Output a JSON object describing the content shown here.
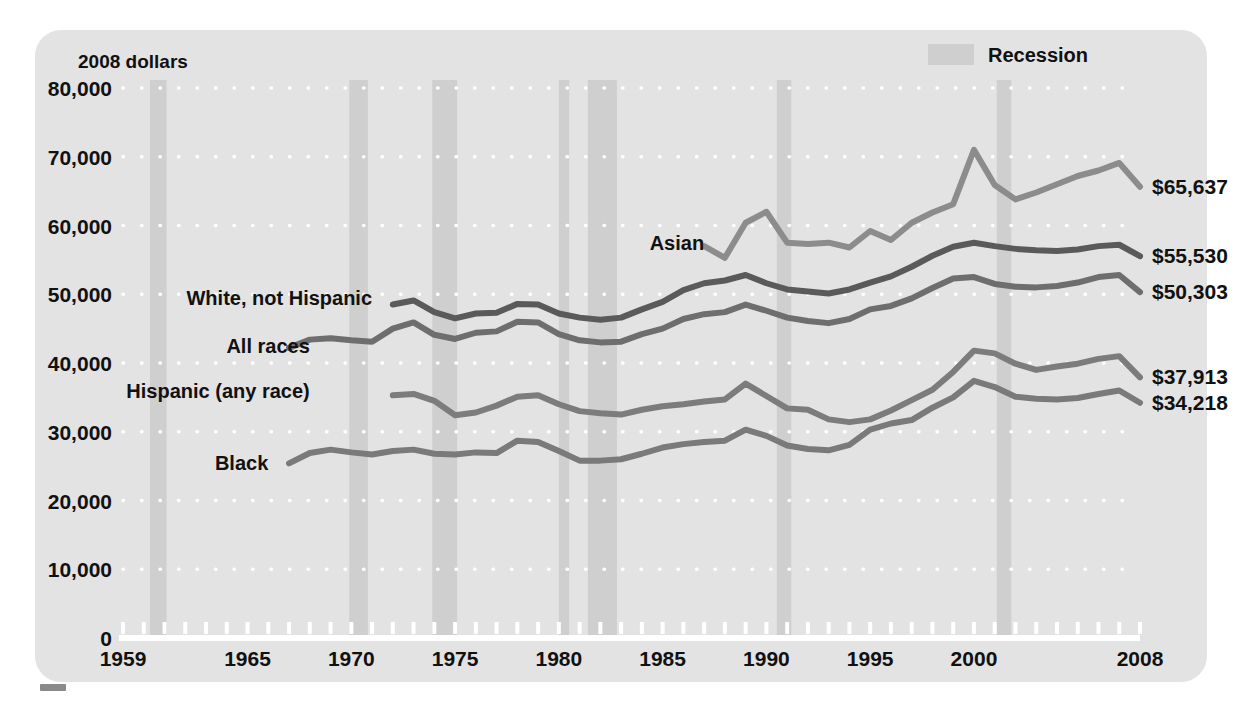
{
  "figure": {
    "unit_label": "2008 dollars",
    "legend": {
      "recession_label": "Recession",
      "swatch_color": "#cfcfcf"
    },
    "background": "#e3e3e3",
    "gridline_color": "#ffffff",
    "axis_color": "#ffffff"
  },
  "chart_data": {
    "type": "line",
    "title": "",
    "subtitle": "",
    "xlabel": "",
    "ylabel": "2008 dollars",
    "xlim": [
      1959,
      2008
    ],
    "ylim": [
      0,
      80000
    ],
    "ytick_labels": [
      "0",
      "10,000",
      "20,000",
      "30,000",
      "40,000",
      "50,000",
      "60,000",
      "70,000",
      "80,000"
    ],
    "ytick_values": [
      0,
      10000,
      20000,
      30000,
      40000,
      50000,
      60000,
      70000,
      80000
    ],
    "xtick_labels": [
      "1959",
      "1965",
      "1970",
      "1975",
      "1980",
      "1985",
      "1990",
      "1995",
      "2000",
      "2008"
    ],
    "xtick_values": [
      1959,
      1965,
      1970,
      1975,
      1980,
      1985,
      1990,
      1995,
      2000,
      2008
    ],
    "minor_xticks_every": 1,
    "grid": "horizontal-dotted-white",
    "legend_position": "top-right",
    "annotations": [
      {
        "text": "Asian",
        "x": 1987,
        "y": 57500,
        "anchor": "end"
      },
      {
        "text": "White, not Hispanic",
        "x": 1971,
        "y": 49500,
        "anchor": "end"
      },
      {
        "text": "All races",
        "x": 1968,
        "y": 42500,
        "anchor": "end"
      },
      {
        "text": "Hispanic (any race)",
        "x": 1968,
        "y": 36000,
        "anchor": "end"
      },
      {
        "text": "Black",
        "x": 1966,
        "y": 25500,
        "anchor": "end"
      }
    ],
    "end_value_labels": [
      {
        "series": "Asian",
        "text": "$65,637",
        "value": 65637
      },
      {
        "series": "White, not Hispanic",
        "text": "$55,530",
        "value": 55530
      },
      {
        "series": "All races",
        "text": "$50,303",
        "value": 50303
      },
      {
        "series": "Hispanic (any race)",
        "text": "$37,913",
        "value": 37913
      },
      {
        "series": "Black",
        "text": "$34,218",
        "value": 34218
      }
    ],
    "recession_bands": [
      {
        "start": 1960.3,
        "end": 1961.1
      },
      {
        "start": 1969.9,
        "end": 1970.8
      },
      {
        "start": 1973.9,
        "end": 1975.1
      },
      {
        "start": 1980.0,
        "end": 1980.5
      },
      {
        "start": 1981.4,
        "end": 1982.8
      },
      {
        "start": 1990.5,
        "end": 1991.2
      },
      {
        "start": 2001.1,
        "end": 2001.8
      }
    ],
    "series": [
      {
        "name": "Asian",
        "color": "#8c8c8c",
        "x": [
          1987,
          1988,
          1989,
          1990,
          1991,
          1992,
          1993,
          1994,
          1995,
          1996,
          1997,
          1998,
          1999,
          2000,
          2001,
          2002,
          2003,
          2004,
          2005,
          2006,
          2007,
          2008
        ],
        "values": [
          57000,
          55300,
          60400,
          62000,
          57500,
          57300,
          57500,
          56800,
          59200,
          57900,
          60400,
          61900,
          63100,
          71000,
          65900,
          63800,
          64800,
          66000,
          67200,
          68000,
          69100,
          65637
        ]
      },
      {
        "name": "White, not Hispanic",
        "color": "#5a5a5a",
        "x": [
          1972,
          1973,
          1974,
          1975,
          1976,
          1977,
          1978,
          1979,
          1980,
          1981,
          1982,
          1983,
          1984,
          1985,
          1986,
          1987,
          1988,
          1989,
          1990,
          1991,
          1992,
          1993,
          1994,
          1995,
          1996,
          1997,
          1998,
          1999,
          2000,
          2001,
          2002,
          2003,
          2004,
          2005,
          2006,
          2007,
          2008
        ],
        "values": [
          48500,
          49100,
          47400,
          46500,
          47200,
          47300,
          48600,
          48500,
          47200,
          46600,
          46300,
          46600,
          47800,
          48900,
          50600,
          51600,
          52000,
          52800,
          51600,
          50700,
          50400,
          50100,
          50700,
          51700,
          52600,
          54000,
          55600,
          56900,
          57500,
          57000,
          56600,
          56400,
          56300,
          56500,
          57000,
          57200,
          55530
        ]
      },
      {
        "name": "All races",
        "color": "#6e6e6e",
        "x": [
          1967,
          1968,
          1969,
          1970,
          1971,
          1972,
          1973,
          1974,
          1975,
          1976,
          1977,
          1978,
          1979,
          1980,
          1981,
          1982,
          1983,
          1984,
          1985,
          1986,
          1987,
          1988,
          1989,
          1990,
          1991,
          1992,
          1993,
          1994,
          1995,
          1996,
          1997,
          1998,
          1999,
          2000,
          2001,
          2002,
          2003,
          2004,
          2005,
          2006,
          2007,
          2008
        ],
        "values": [
          42200,
          43400,
          43600,
          43300,
          43100,
          45000,
          45900,
          44100,
          43500,
          44400,
          44600,
          46000,
          45900,
          44200,
          43300,
          43000,
          43100,
          44200,
          45000,
          46400,
          47100,
          47400,
          48500,
          47600,
          46600,
          46100,
          45800,
          46400,
          47800,
          48300,
          49400,
          50900,
          52300,
          52500,
          51500,
          51100,
          51000,
          51200,
          51700,
          52500,
          52800,
          50303
        ]
      },
      {
        "name": "Hispanic (any race)",
        "color": "#7c7c7c",
        "x": [
          1972,
          1973,
          1974,
          1975,
          1976,
          1977,
          1978,
          1979,
          1980,
          1981,
          1982,
          1983,
          1984,
          1985,
          1986,
          1987,
          1988,
          1989,
          1990,
          1991,
          1992,
          1993,
          1994,
          1995,
          1996,
          1997,
          1998,
          1999,
          2000,
          2001,
          2002,
          2003,
          2004,
          2005,
          2006,
          2007,
          2008
        ],
        "values": [
          35300,
          35500,
          34500,
          32400,
          32800,
          33800,
          35100,
          35300,
          34000,
          33000,
          32700,
          32500,
          33200,
          33700,
          34000,
          34400,
          34700,
          37000,
          35200,
          33400,
          33200,
          31800,
          31400,
          31800,
          33100,
          34600,
          36100,
          38700,
          41800,
          41400,
          39900,
          39000,
          39500,
          39900,
          40600,
          41000,
          37913
        ]
      },
      {
        "name": "Black",
        "color": "#7a7a7a",
        "x": [
          1967,
          1968,
          1969,
          1970,
          1971,
          1972,
          1973,
          1974,
          1975,
          1976,
          1977,
          1978,
          1979,
          1980,
          1981,
          1982,
          1983,
          1984,
          1985,
          1986,
          1987,
          1988,
          1989,
          1990,
          1991,
          1992,
          1993,
          1994,
          1995,
          1996,
          1997,
          1998,
          1999,
          2000,
          2001,
          2002,
          2003,
          2004,
          2005,
          2006,
          2007,
          2008
        ],
        "values": [
          25400,
          26900,
          27400,
          27000,
          26700,
          27200,
          27400,
          26800,
          26700,
          27000,
          26900,
          28700,
          28500,
          27200,
          25800,
          25800,
          26000,
          26800,
          27700,
          28200,
          28500,
          28700,
          30300,
          29400,
          28000,
          27500,
          27300,
          28100,
          30300,
          31200,
          31700,
          33500,
          35000,
          37400,
          36500,
          35100,
          34800,
          34700,
          34900,
          35500,
          36000,
          34218
        ]
      }
    ]
  }
}
